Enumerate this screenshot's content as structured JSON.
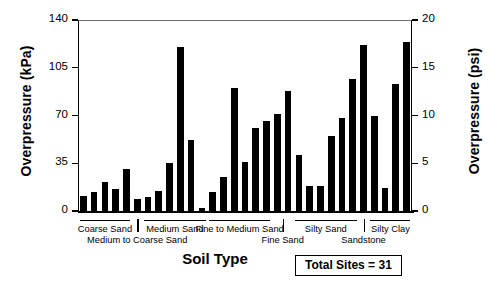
{
  "chart_data": {
    "type": "bar",
    "title": "",
    "subtitle": "",
    "xlabel": "Soil Type",
    "ylabel": "Overpressure (kPa)",
    "ylabel_secondary": "Overpressure (psi)",
    "ylim": [
      0,
      140
    ],
    "ylim_secondary": [
      0,
      20
    ],
    "yticks": [
      0,
      35,
      70,
      105,
      140
    ],
    "yticks_secondary": [
      0,
      5,
      10,
      15,
      20
    ],
    "grid": false,
    "legend": "none",
    "bar_color": "#000000",
    "background": "#ffffff",
    "n_sites": 31,
    "annotation": "Total Sites = 31",
    "units_note": "1 psi = 6.895 kPa",
    "categories": [
      "Site 1",
      "Site 2",
      "Site 3",
      "Site 4",
      "Site 5",
      "Site 6",
      "Site 7",
      "Site 8",
      "Site 9",
      "Site 10",
      "Site 11",
      "Site 12",
      "Site 13",
      "Site 14",
      "Site 15",
      "Site 16",
      "Site 17",
      "Site 18",
      "Site 19",
      "Site 20",
      "Site 21",
      "Site 22",
      "Site 23",
      "Site 24",
      "Site 25",
      "Site 26",
      "Site 27",
      "Site 28",
      "Site 29",
      "Site 30",
      "Site 31"
    ],
    "values": [
      11,
      14,
      21,
      16,
      31,
      9,
      10,
      15,
      35,
      120,
      52,
      2,
      14,
      25,
      90,
      36,
      61,
      66,
      71,
      88,
      41,
      18,
      18,
      55,
      68,
      97,
      122,
      70,
      17,
      93,
      124
    ],
    "values_psi": [
      1.6,
      2.0,
      3.0,
      2.3,
      4.5,
      1.3,
      1.5,
      2.2,
      5.1,
      17.4,
      7.5,
      0.3,
      2.0,
      3.6,
      13.1,
      5.2,
      8.8,
      9.6,
      10.3,
      12.8,
      5.9,
      2.6,
      2.6,
      8.0,
      9.9,
      14.1,
      17.7,
      10.2,
      2.5,
      13.5,
      18.0
    ],
    "groups": [
      {
        "label": "Coarse Sand",
        "start": 0,
        "end": 4,
        "row": 0
      },
      {
        "label": "Medium to Coarse Sand",
        "start": 5,
        "end": 5,
        "row": 1
      },
      {
        "label": "Medium Sand",
        "start": 6,
        "end": 11,
        "row": 0
      },
      {
        "label": "Fine to Medium Sand",
        "start": 12,
        "end": 17,
        "row": 0
      },
      {
        "label": "Fine Sand",
        "start": 18,
        "end": 19,
        "row": 1
      },
      {
        "label": "Silty Sand",
        "start": 20,
        "end": 25,
        "row": 0
      },
      {
        "label": "Sandstone",
        "start": 26,
        "end": 26,
        "row": 1
      },
      {
        "label": "Silty Clay",
        "start": 27,
        "end": 30,
        "row": 0
      }
    ]
  },
  "axes": {
    "left": {
      "title": "Overpressure (kPa)",
      "ticks": [
        "140",
        "105",
        "70",
        "35",
        "0"
      ]
    },
    "right": {
      "title": "Overpressure (psi)",
      "ticks": [
        "20",
        "15",
        "10",
        "5",
        "0"
      ]
    },
    "bottom": {
      "title": "Soil Type"
    }
  },
  "group_labels": {
    "coarse_sand": "Coarse Sand",
    "medium_to_coarse_sand": "Medium to Coarse Sand",
    "medium_sand": "Medium Sand",
    "fine_to_medium_sand": "Fine to Medium Sand",
    "fine_sand": "Fine Sand",
    "silty_sand": "Silty Sand",
    "sandstone": "Sandstone",
    "silty_clay": "Silty Clay"
  },
  "annotation_box": {
    "text": "Total Sites = 31"
  }
}
